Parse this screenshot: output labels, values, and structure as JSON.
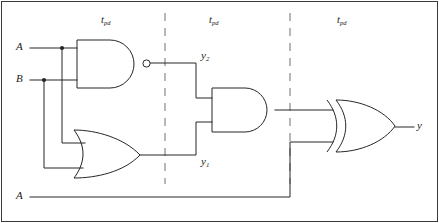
{
  "figure": {
    "kind": "logic-circuit-diagram",
    "title": "",
    "stroke_color": "#262626",
    "dash_color": "#8c8c8c",
    "background": "#ffffff",
    "line_width": 1
  },
  "inputs": [
    {
      "name": "input-a-top",
      "label": "A",
      "x": 18,
      "y": 48
    },
    {
      "name": "input-b",
      "label": "B",
      "x": 18,
      "y": 80
    },
    {
      "name": "input-a-bottom",
      "label": "A",
      "x": 18,
      "y": 197
    }
  ],
  "outputs": [
    {
      "name": "output-y",
      "label": "y",
      "x": 418,
      "y": 127
    }
  ],
  "internal_nodes": [
    {
      "name": "node-y2",
      "label": "y",
      "subscript": "2",
      "x": 203,
      "y": 57
    },
    {
      "name": "node-y1",
      "label": "y",
      "subscript": "1",
      "x": 203,
      "y": 163
    }
  ],
  "stage_labels": [
    {
      "name": "tpd-stage-1",
      "label": "t",
      "subscript": "pd",
      "x": 104,
      "y": 22
    },
    {
      "name": "tpd-stage-2",
      "label": "t",
      "subscript": "pd",
      "x": 212,
      "y": 22
    },
    {
      "name": "tpd-stage-3",
      "label": "t",
      "subscript": "pd",
      "x": 340,
      "y": 22
    }
  ],
  "gates": [
    {
      "name": "nand-gate",
      "type": "NAND",
      "inputs": [
        "A",
        "B"
      ],
      "output": "y2",
      "x": 77,
      "y": 40,
      "width": 66,
      "height": 48,
      "bubble": true
    },
    {
      "name": "or-gate",
      "type": "OR",
      "inputs": [
        "A",
        "B"
      ],
      "output": "y1",
      "x": 74,
      "y": 130,
      "width": 66,
      "height": 48,
      "bubble": false
    },
    {
      "name": "and-gate",
      "type": "AND",
      "inputs": [
        "y2",
        "y1"
      ],
      "output": "n1",
      "x": 212,
      "y": 88,
      "width": 63,
      "height": 44,
      "bubble": false
    },
    {
      "name": "xor-gate",
      "type": "XOR",
      "inputs": [
        "n1",
        "A"
      ],
      "output": "y",
      "x": 327,
      "y": 100,
      "width": 68,
      "height": 52,
      "bubble": false
    }
  ],
  "dividers": [
    {
      "name": "stage-divider-1",
      "x": 165,
      "y1": 12,
      "y2": 185
    },
    {
      "name": "stage-divider-2",
      "x": 290,
      "y1": 12,
      "y2": 185
    }
  ],
  "junctions": [
    {
      "name": "junction-a",
      "x": 62,
      "y": 48
    },
    {
      "name": "junction-b",
      "x": 44,
      "y": 80
    }
  ],
  "frame": {
    "name": "figure-border",
    "x": 1,
    "y": 1,
    "width": 437,
    "height": 221
  }
}
